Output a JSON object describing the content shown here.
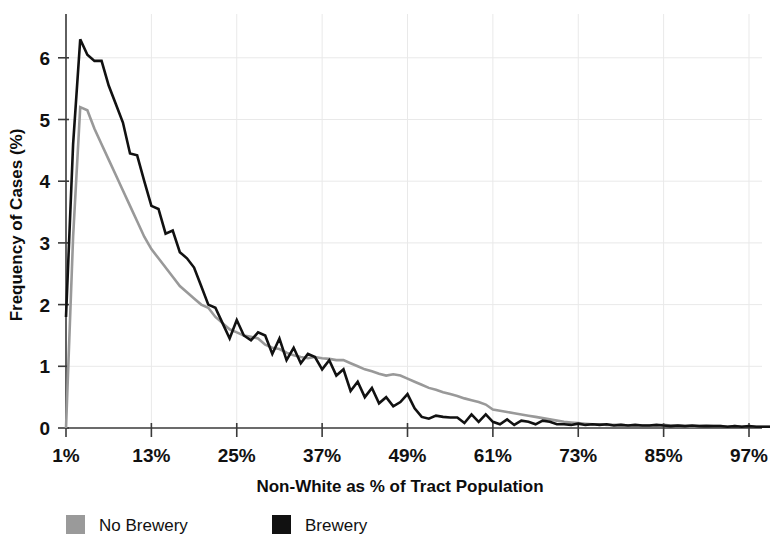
{
  "chart_data": {
    "type": "line",
    "title": "",
    "xlabel": "Non-White as % of Tract Population",
    "ylabel": "Frequency of Cases (%)",
    "xlim": [
      1,
      100
    ],
    "ylim": [
      0,
      6.6
    ],
    "xticks": [
      "1%",
      "13%",
      "25%",
      "37%",
      "49%",
      "61%",
      "73%",
      "85%",
      "97%"
    ],
    "xtick_values": [
      1,
      13,
      25,
      37,
      49,
      61,
      73,
      85,
      97
    ],
    "yticks": [
      "0",
      "1",
      "2",
      "3",
      "4",
      "5",
      "6"
    ],
    "ytick_values": [
      0,
      1,
      2,
      3,
      4,
      5,
      6
    ],
    "grid": true,
    "grid_style": "light dotted vertical and horizontal",
    "legend_position": "below-axis",
    "x": [
      1,
      2,
      3,
      4,
      5,
      6,
      7,
      8,
      9,
      10,
      11,
      12,
      13,
      14,
      15,
      16,
      17,
      18,
      19,
      20,
      21,
      22,
      23,
      24,
      25,
      26,
      27,
      28,
      29,
      30,
      31,
      32,
      33,
      34,
      35,
      36,
      37,
      38,
      39,
      40,
      41,
      42,
      43,
      44,
      45,
      46,
      47,
      48,
      49,
      50,
      51,
      52,
      53,
      54,
      55,
      56,
      57,
      58,
      59,
      60,
      61,
      62,
      63,
      64,
      65,
      66,
      67,
      68,
      69,
      70,
      71,
      72,
      73,
      74,
      75,
      76,
      77,
      78,
      79,
      80,
      81,
      82,
      83,
      84,
      85,
      86,
      87,
      88,
      89,
      90,
      91,
      92,
      93,
      94,
      95,
      96,
      97,
      98,
      99,
      100
    ],
    "series": [
      {
        "name": "Brewery",
        "color": "#111111",
        "linewidth": 2.6,
        "values": [
          1.8,
          4.6,
          6.3,
          6.05,
          5.95,
          5.95,
          5.55,
          5.25,
          4.95,
          4.45,
          4.42,
          4.0,
          3.6,
          3.55,
          3.15,
          3.2,
          2.85,
          2.75,
          2.6,
          2.3,
          2.0,
          1.95,
          1.7,
          1.45,
          1.75,
          1.5,
          1.42,
          1.55,
          1.5,
          1.2,
          1.45,
          1.1,
          1.3,
          1.05,
          1.2,
          1.15,
          0.95,
          1.1,
          0.85,
          0.95,
          0.6,
          0.75,
          0.5,
          0.65,
          0.4,
          0.5,
          0.35,
          0.42,
          0.55,
          0.32,
          0.18,
          0.15,
          0.2,
          0.18,
          0.17,
          0.17,
          0.08,
          0.22,
          0.1,
          0.22,
          0.1,
          0.06,
          0.14,
          0.05,
          0.12,
          0.1,
          0.06,
          0.12,
          0.1,
          0.06,
          0.06,
          0.05,
          0.07,
          0.05,
          0.06,
          0.05,
          0.06,
          0.04,
          0.05,
          0.04,
          0.05,
          0.04,
          0.04,
          0.05,
          0.04,
          0.03,
          0.04,
          0.03,
          0.04,
          0.03,
          0.03,
          0.03,
          0.03,
          0.02,
          0.03,
          0.02,
          0.03,
          0.02,
          0.02,
          0.02
        ]
      },
      {
        "name": "No Brewery",
        "color": "#999999",
        "linewidth": 2.6,
        "values": [
          0.0,
          3.1,
          5.2,
          5.15,
          4.85,
          4.6,
          4.35,
          4.1,
          3.85,
          3.6,
          3.35,
          3.1,
          2.9,
          2.75,
          2.6,
          2.45,
          2.3,
          2.2,
          2.1,
          2.0,
          1.95,
          1.8,
          1.7,
          1.6,
          1.55,
          1.5,
          1.48,
          1.45,
          1.35,
          1.3,
          1.28,
          1.22,
          1.18,
          1.15,
          1.13,
          1.15,
          1.13,
          1.12,
          1.1,
          1.1,
          1.05,
          1.0,
          0.95,
          0.92,
          0.88,
          0.85,
          0.87,
          0.85,
          0.8,
          0.75,
          0.7,
          0.65,
          0.62,
          0.58,
          0.55,
          0.52,
          0.48,
          0.45,
          0.42,
          0.38,
          0.3,
          0.28,
          0.26,
          0.24,
          0.22,
          0.2,
          0.18,
          0.16,
          0.14,
          0.12,
          0.1,
          0.09,
          0.08,
          0.07,
          0.06,
          0.06,
          0.05,
          0.05,
          0.05,
          0.04,
          0.04,
          0.04,
          0.04,
          0.04,
          0.05,
          0.04,
          0.04,
          0.03,
          0.03,
          0.03,
          0.04,
          0.03,
          0.03,
          0.02,
          0.03,
          0.02,
          0.03,
          0.02,
          0.02,
          0.02
        ]
      }
    ]
  },
  "legend": {
    "entries": [
      {
        "label": "No Brewery",
        "color": "#9a9a9a",
        "swatch": "gray-square"
      },
      {
        "label": "Brewery",
        "color": "#111111",
        "swatch": "black-square"
      }
    ]
  },
  "axes": {
    "x_title": "Non-White as % of Tract Population",
    "y_title": "Frequency of Cases (%)"
  }
}
